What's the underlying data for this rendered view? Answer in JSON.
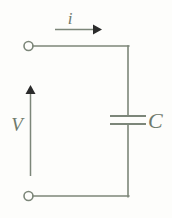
{
  "figure": {
    "kind": "circuit-diagram",
    "width": 172,
    "height": 218,
    "background_color": "#fdfdfb",
    "line_color": "#7c8679",
    "label_color": "#6f7a6c",
    "line_width": 1.6
  },
  "labels": {
    "current": "i",
    "voltage": "V",
    "component": "C"
  },
  "components": {
    "capacitor": {
      "name": "capacitor",
      "label": "C",
      "plate_gap": 8,
      "plate_width": 32,
      "plate_y_top": 116,
      "plate_y_bottom": 124,
      "center_x": 128
    },
    "terminal_top": {
      "name": "terminal-top",
      "cx": 28.5,
      "cy": 46,
      "r": 4.6
    },
    "terminal_bottom": {
      "name": "terminal-bottom",
      "cx": 28.5,
      "cy": 196,
      "r": 4.6
    }
  },
  "arrows": {
    "current": {
      "name": "current-arrow",
      "direction": "right",
      "x_start": 55,
      "x_end": 101,
      "y": 29
    },
    "voltage": {
      "name": "voltage-arrow",
      "direction": "up",
      "x": 30,
      "y_start": 176,
      "y_end": 86
    }
  },
  "wires": {
    "top": {
      "x1": 33,
      "y1": 46,
      "x2": 128,
      "y2": 46
    },
    "right_upper": {
      "x1": 128,
      "y1": 46,
      "x2": 128,
      "y2": 116
    },
    "right_lower": {
      "x1": 128,
      "y1": 124,
      "x2": 128,
      "y2": 196
    },
    "bottom": {
      "x1": 33,
      "y1": 196,
      "x2": 128,
      "y2": 196
    }
  }
}
